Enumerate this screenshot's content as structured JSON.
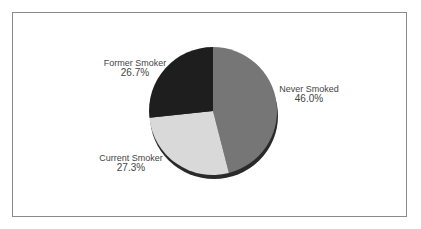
{
  "chart_data": {
    "type": "pie",
    "title": "",
    "slices": [
      {
        "label": "Never Smoked",
        "value": 46.0,
        "display": "46.0%",
        "color": "#767676"
      },
      {
        "label": "Current Smoker",
        "value": 27.3,
        "display": "27.3%",
        "color": "#d9d9d9"
      },
      {
        "label": "Former Smoker",
        "value": 26.7,
        "display": "26.7%",
        "color": "#1e1e1e"
      }
    ],
    "start_angle_deg": 0,
    "direction": "clockwise",
    "legend": "none",
    "style": "3d-shadow"
  },
  "labels": {
    "never": {
      "name": "Never Smoked",
      "pct": "46.0%"
    },
    "current": {
      "name": "Current Smoker",
      "pct": "27.3%"
    },
    "former": {
      "name": "Former Smoker",
      "pct": "26.7%"
    }
  }
}
